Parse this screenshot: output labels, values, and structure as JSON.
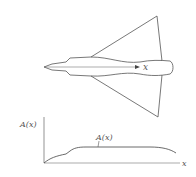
{
  "diagram": {
    "aircraft": {
      "axis_label": "x",
      "description": "delta-wing aircraft planform, top view"
    },
    "area_plot": {
      "y_axis_label": "A(x)",
      "x_axis_label": "x",
      "curve_label": "A(x)"
    },
    "colors": {
      "line": "#555555",
      "background": "#ffffff"
    }
  }
}
